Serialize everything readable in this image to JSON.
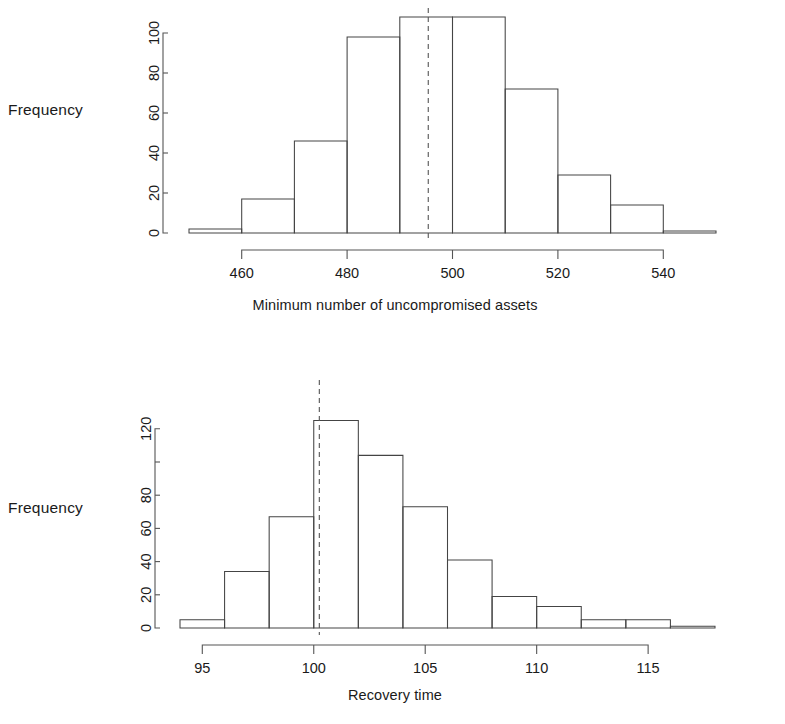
{
  "figure": {
    "background": "#ffffff",
    "ink_color": "#1a1a1a",
    "axis_color": "#555555",
    "bar_color": "#444444"
  },
  "panels": [
    {
      "id": "panel-assets",
      "ylabel": "Frequency",
      "xlabel": "Minimum number of uncompromised assets",
      "y_ticks": [
        "0",
        "20",
        "40",
        "60",
        "80",
        "100"
      ],
      "x_ticks": [
        "460",
        "480",
        "500",
        "520",
        "540"
      ]
    },
    {
      "id": "panel-recovery",
      "ylabel": "Frequency",
      "xlabel": "Recovery time",
      "y_ticks": [
        "0",
        "20",
        "40",
        "60",
        "80",
        "",
        "120"
      ],
      "x_ticks": [
        "95",
        "100",
        "105",
        "110",
        "115"
      ]
    }
  ],
  "chart_data": [
    {
      "type": "bar",
      "subtype": "histogram",
      "title": "",
      "xlabel": "Minimum number of uncompromised assets",
      "ylabel": "Frequency",
      "bin_width": 10,
      "bin_edges": [
        450,
        460,
        470,
        480,
        490,
        500,
        510,
        520,
        530,
        540,
        550
      ],
      "categories": [
        "450-460",
        "460-470",
        "470-480",
        "480-490",
        "490-500",
        "500-510",
        "510-520",
        "520-530",
        "530-540",
        "540-550"
      ],
      "values": [
        2,
        17,
        46,
        98,
        108,
        108,
        72,
        29,
        14,
        1
      ],
      "xlim": [
        450,
        550
      ],
      "ylim": [
        0,
        110
      ],
      "y_ticks": [
        0,
        20,
        40,
        60,
        80,
        100
      ],
      "x_ticks": [
        460,
        480,
        500,
        520,
        540
      ],
      "grid": false,
      "legend": null,
      "annotations": [
        {
          "type": "vline",
          "style": "dashed",
          "x": 495.4,
          "label": ""
        }
      ]
    },
    {
      "type": "bar",
      "subtype": "histogram",
      "title": "",
      "xlabel": "Recovery time",
      "ylabel": "Frequency",
      "bin_width": 2,
      "bin_edges": [
        94,
        96,
        98,
        100,
        102,
        104,
        106,
        108,
        110,
        112,
        114,
        116,
        118
      ],
      "categories": [
        "94-96",
        "96-98",
        "98-100",
        "100-102",
        "102-104",
        "104-106",
        "106-108",
        "108-110",
        "110-112",
        "112-114",
        "114-116",
        "116-118"
      ],
      "values": [
        5,
        34,
        67,
        125,
        104,
        73,
        41,
        19,
        13,
        5,
        5,
        1
      ],
      "xlim": [
        94,
        118
      ],
      "ylim": [
        0,
        128
      ],
      "y_ticks": [
        0,
        20,
        40,
        60,
        80,
        100,
        120
      ],
      "x_ticks": [
        95,
        100,
        105,
        110,
        115
      ],
      "grid": false,
      "legend": null,
      "annotations": [
        {
          "type": "vline",
          "style": "dashed",
          "x": 100.25,
          "label": ""
        }
      ]
    }
  ]
}
